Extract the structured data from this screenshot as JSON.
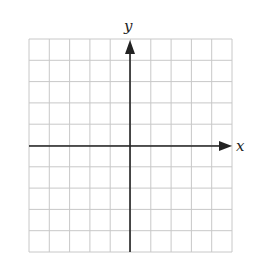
{
  "chart_data": {
    "type": "scatter",
    "title": "",
    "xlabel": "x",
    "ylabel": "y",
    "grid": true,
    "grid_columns": 10,
    "grid_rows": 10,
    "series": [],
    "xlim": [
      -5,
      5
    ],
    "ylim": [
      -5,
      5
    ],
    "tick_labels": false
  },
  "axes": {
    "x_label": "x",
    "y_label": "y"
  },
  "colors": {
    "grid": "#c8c8c8",
    "axis": "#222222",
    "background": "#ffffff"
  }
}
